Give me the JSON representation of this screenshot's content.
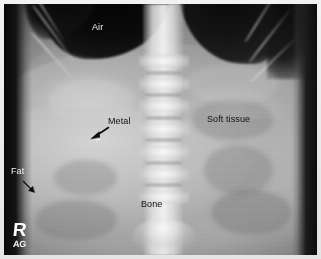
{
  "figure": {
    "type": "radiograph",
    "modality": "X-ray",
    "view": "abdominal"
  },
  "annotations": [
    {
      "id": "air",
      "label": "Air",
      "density": "air",
      "text_color": "#f0f0f0",
      "has_arrow": false,
      "x": 88,
      "y": 19
    },
    {
      "id": "metal",
      "label": "Metal",
      "density": "metal",
      "text_color": "#111111",
      "has_arrow": true,
      "arrow_direction": "down-left",
      "x": 104,
      "y": 113
    },
    {
      "id": "soft-tissue",
      "label": "Soft tissue",
      "density": "soft-tissue",
      "text_color": "#111111",
      "has_arrow": false,
      "x": 203,
      "y": 111
    },
    {
      "id": "bone",
      "label": "Bone",
      "density": "bone",
      "text_color": "#111111",
      "has_arrow": false,
      "x": 137,
      "y": 196
    },
    {
      "id": "fat",
      "label": "Fat",
      "density": "fat",
      "text_color": "#f0f0f0",
      "has_arrow": true,
      "arrow_direction": "down-right",
      "x": 7,
      "y": 163
    }
  ],
  "side_marker": {
    "letter": "R",
    "sub": "AG",
    "meaning": "right-side-marker"
  },
  "colors": {
    "film_light": "#d6d6d6",
    "film_mid": "#8a8a8a",
    "film_dark": "#0a0a0a",
    "bone_bright": "#fafafa",
    "label_light": "#f0f0f0",
    "label_dark": "#111111",
    "frame": "#f2f2f2"
  }
}
